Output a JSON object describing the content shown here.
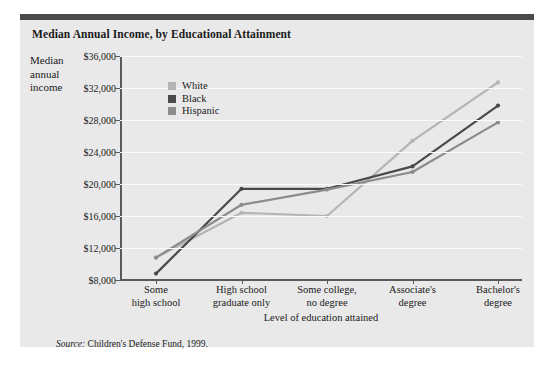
{
  "figure": {
    "title": "Median Annual Income, by Educational Attainment",
    "source_prefix": "Source:",
    "source_text": "Children's Defense Fund, 1999.",
    "accent_bar_color": "#4a4a4a",
    "background_color": "#e9e9e9"
  },
  "chart_data": {
    "type": "line",
    "title": "Median Annual Income, by Educational Attainment",
    "xlabel": "Level of education attained",
    "ylabel": "Median annual income",
    "ylabel_lines": [
      "Median",
      "annual",
      "income"
    ],
    "categories": [
      [
        "Some",
        "high school"
      ],
      [
        "High school",
        "graduate only"
      ],
      [
        "Some college,",
        "no degree"
      ],
      [
        "Associate's",
        "degree"
      ],
      [
        "Bachelor's",
        "degree"
      ]
    ],
    "category_labels": [
      "Some high school",
      "High school graduate only",
      "Some college, no degree",
      "Associate's degree",
      "Bachelor's degree"
    ],
    "ylim": [
      8000,
      36000
    ],
    "yticks": [
      8000,
      12000,
      16000,
      20000,
      24000,
      28000,
      32000,
      36000
    ],
    "ytick_labels": [
      "$8,000",
      "$12,000",
      "$16,000",
      "$20,000",
      "$24,000",
      "$28,000",
      "$32,000",
      "$36,000"
    ],
    "grid": true,
    "legend_position": "upper-left-inside",
    "series": [
      {
        "name": "White",
        "color": "#b4b4b4",
        "values": [
          10800,
          16400,
          16000,
          25400,
          32700
        ]
      },
      {
        "name": "Black",
        "color": "#4a4a4a",
        "values": [
          8800,
          19400,
          19400,
          22200,
          29800
        ]
      },
      {
        "name": "Hispanic",
        "color": "#8c8c8c",
        "values": [
          10800,
          17400,
          19300,
          21500,
          27700
        ]
      }
    ]
  }
}
